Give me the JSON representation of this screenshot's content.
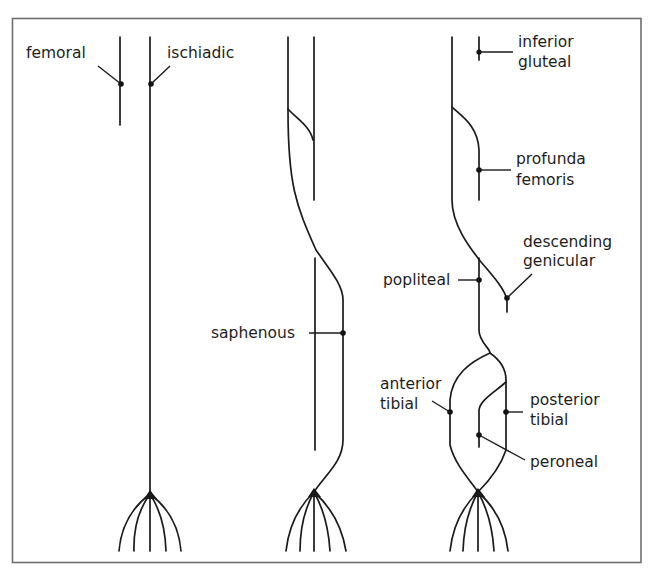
{
  "diagram": {
    "type": "anatomical schematic",
    "panels": [
      {
        "id": "left",
        "labels": [
          {
            "key": "femoral",
            "lines": [
              "femoral"
            ]
          },
          {
            "key": "ischiadic",
            "lines": [
              "ischiadic"
            ]
          }
        ]
      },
      {
        "id": "middle",
        "labels": [
          {
            "key": "saphenous",
            "lines": [
              "saphenous"
            ]
          }
        ]
      },
      {
        "id": "right",
        "labels": [
          {
            "key": "inferior-gluteal",
            "lines": [
              "inferior",
              "gluteal"
            ]
          },
          {
            "key": "profunda-femoris",
            "lines": [
              "profunda",
              "femoris"
            ]
          },
          {
            "key": "descending-genicular",
            "lines": [
              "descending",
              "genicular"
            ]
          },
          {
            "key": "popliteal",
            "lines": [
              "popliteal"
            ]
          },
          {
            "key": "anterior-tibial",
            "lines": [
              "anterior",
              "tibial"
            ]
          },
          {
            "key": "posterior-tibial",
            "lines": [
              "posterior",
              "tibial"
            ]
          },
          {
            "key": "peroneal",
            "lines": [
              "peroneal"
            ]
          }
        ]
      }
    ]
  },
  "colors": {
    "line": "#1b1b1b",
    "frame": "#6e6e6e",
    "background": "#ffffff"
  }
}
